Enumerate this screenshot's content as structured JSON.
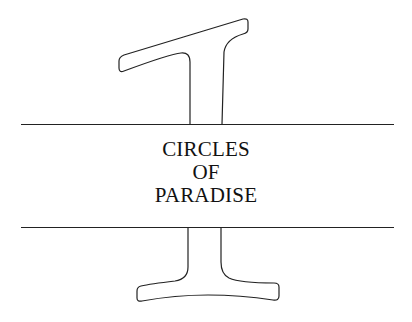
{
  "chapter": {
    "number": "1",
    "title_lines": [
      "CIRCLES",
      "OF",
      "PARADISE"
    ]
  },
  "colors": {
    "background": "#ffffff",
    "ink": "#222222"
  }
}
